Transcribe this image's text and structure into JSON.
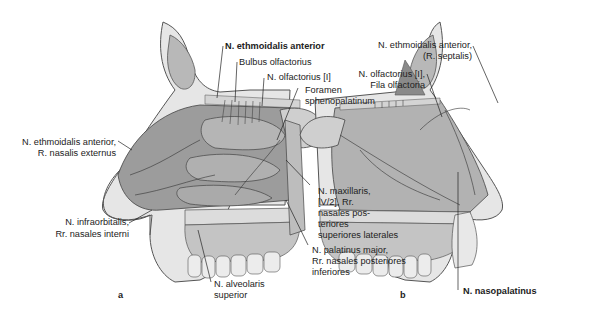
{
  "figure": {
    "panels": [
      {
        "id": "a",
        "label": "a"
      },
      {
        "id": "b",
        "label": "b"
      }
    ],
    "panel_a_labels": {
      "ethmoidalis_anterior": "N. ethmoidalis anterior",
      "bulbus": "Bulbus olfactorius",
      "olfactorius": "N. olfactorius [I]",
      "foramen_1": "Foramen",
      "foramen_2": "sphenopalatinum",
      "ethm_ext_1": "N. ethmoidalis anterior,",
      "ethm_ext_2": "R. nasalis externus",
      "maxillaris_1": "N. maxillaris,",
      "maxillaris_2": "[V/2], Rr.",
      "maxillaris_3": "nasales pos-",
      "maxillaris_4": "teriores",
      "maxillaris_5": "superiores laterales",
      "infraorb_1": "N. infraorbitalis,",
      "infraorb_2": "Rr. nasales interni",
      "palatinus_1": "N. palatinus major,",
      "palatinus_2": "Rr. nasales posteriores",
      "palatinus_3": "inferiores",
      "alveolaris_1": "N. alveolaris",
      "alveolaris_2": "superior"
    },
    "panel_b_labels": {
      "ethm_sept_1": "N. ethmoidalis anterior,",
      "ethm_sept_2": "(R. septalis)",
      "olf_fila_1": "N. olfactorius [I],",
      "olf_fila_2": "Fila olfactoria",
      "nasopalatinus": "N. nasopalatinus"
    }
  }
}
